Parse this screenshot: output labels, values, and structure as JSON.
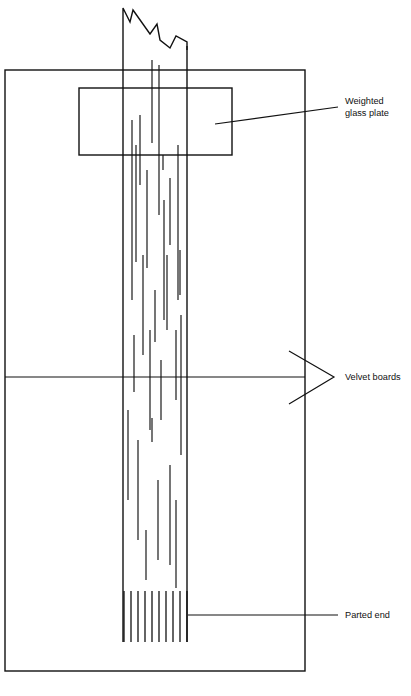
{
  "figure": {
    "domain_kind": "technical-line-diagram",
    "canvas": {
      "width": 411,
      "height": 696
    },
    "stroke_color": "#111111",
    "background_color": "#ffffff"
  },
  "labels": [
    {
      "id": "weighted-glass-plate",
      "line1": "Weighted",
      "line2": "glass plate",
      "text_x": 345,
      "text_y1": 104,
      "text_y2": 116,
      "leader": {
        "type": "single",
        "x1": 215,
        "y1": 124,
        "x2": 338,
        "y2": 107
      }
    },
    {
      "id": "velvet-boards",
      "line1": "Velvet boards",
      "line2": "",
      "text_x": 345,
      "text_y1": 380,
      "text_y2": 380,
      "leader": {
        "type": "fork",
        "apex_x": 334,
        "apex_y": 377,
        "upper_x": 289,
        "upper_y": 351,
        "lower_x": 289,
        "lower_y": 404
      }
    },
    {
      "id": "parted-end",
      "line1": "Parted end",
      "line2": "",
      "text_x": 345,
      "text_y1": 618,
      "text_y2": 618,
      "leader": {
        "type": "single",
        "x1": 188,
        "y1": 615,
        "x2": 338,
        "y2": 615
      }
    }
  ],
  "outer_frame": {
    "name": "velvet-board-outline",
    "x": 5,
    "y": 70,
    "width": 300,
    "height": 601,
    "divider_y": 377
  },
  "glass_plate": {
    "name": "weighted-glass-plate-rect",
    "x": 79,
    "y": 88,
    "width": 153,
    "height": 67
  },
  "tress": {
    "name": "hair-tress-bundle",
    "left_x": 123,
    "right_x": 187,
    "top_y": 12,
    "bottom_y": 642,
    "break_top_y": 8,
    "break_zigzag": "M123,12 L123,8 L130,22 L133,10 L150,34 L157,24 L160,40 L170,48 L176,36 L187,42 L187,50"
  },
  "inner_strands": [
    {
      "x": 140,
      "y1": 115,
      "y2": 185
    },
    {
      "x": 152,
      "y1": 60,
      "y2": 143
    },
    {
      "x": 159,
      "y1": 65,
      "y2": 215
    },
    {
      "x": 170,
      "y1": 178,
      "y2": 245
    },
    {
      "x": 132,
      "y1": 120,
      "y2": 300
    },
    {
      "x": 136,
      "y1": 145,
      "y2": 262
    },
    {
      "x": 147,
      "y1": 170,
      "y2": 268
    },
    {
      "x": 164,
      "y1": 200,
      "y2": 320
    },
    {
      "x": 178,
      "y1": 145,
      "y2": 300
    },
    {
      "x": 143,
      "y1": 255,
      "y2": 355
    },
    {
      "x": 155,
      "y1": 290,
      "y2": 342
    },
    {
      "x": 167,
      "y1": 255,
      "y2": 330
    },
    {
      "x": 180,
      "y1": 250,
      "y2": 295
    },
    {
      "x": 134,
      "y1": 335,
      "y2": 392
    },
    {
      "x": 150,
      "y1": 330,
      "y2": 430
    },
    {
      "x": 161,
      "y1": 360,
      "y2": 420
    },
    {
      "x": 176,
      "y1": 330,
      "y2": 400
    },
    {
      "x": 181,
      "y1": 315,
      "y2": 455
    },
    {
      "x": 138,
      "y1": 440,
      "y2": 540
    },
    {
      "x": 152,
      "y1": 418,
      "y2": 442
    },
    {
      "x": 158,
      "y1": 480,
      "y2": 560
    },
    {
      "x": 170,
      "y1": 465,
      "y2": 565
    },
    {
      "x": 146,
      "y1": 530,
      "y2": 580
    },
    {
      "x": 176,
      "y1": 500,
      "y2": 588
    },
    {
      "x": 128,
      "y1": 410,
      "y2": 500
    },
    {
      "x": 163,
      "y1": 155,
      "y2": 170
    }
  ],
  "parted_end": {
    "name": "parted-end-strands",
    "top_y": 591,
    "bottom_y": 642,
    "count": 10,
    "x_positions": [
      124,
      131,
      138,
      145,
      152,
      159,
      166,
      173,
      180,
      187
    ]
  }
}
